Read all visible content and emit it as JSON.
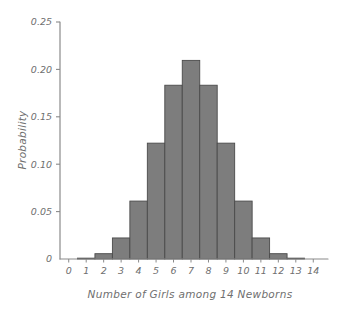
{
  "chart_data": {
    "type": "bar",
    "title": "",
    "xlabel": "Number of Girls among 14 Newborns",
    "ylabel": "Probability",
    "categories": [
      "0",
      "1",
      "2",
      "3",
      "4",
      "5",
      "6",
      "7",
      "8",
      "9",
      "10",
      "11",
      "12",
      "13",
      "14"
    ],
    "values": [
      0.0001,
      0.0009,
      0.0056,
      0.0222,
      0.0611,
      0.1222,
      0.1833,
      0.2095,
      0.1833,
      0.1222,
      0.0611,
      0.0222,
      0.0056,
      0.0009,
      0.0001
    ],
    "xlim": [
      -0.5,
      14.5
    ],
    "ylim": [
      0,
      0.25
    ],
    "ytick_labels": [
      "0.25",
      "0.20",
      "0.15",
      "0.10",
      "0.05",
      "0"
    ],
    "ytick_values": [
      0.25,
      0.2,
      0.15,
      0.1,
      0.05,
      0
    ],
    "xtick_labels": [
      "0",
      "1",
      "2",
      "3",
      "4",
      "5",
      "6",
      "7",
      "8",
      "9",
      "10",
      "11",
      "12",
      "13",
      "14"
    ],
    "grid": false,
    "legend": false,
    "bar_fill": "#7d7d7d",
    "bar_edge": "#4a4a4a",
    "axis_color": "#8a8a8a",
    "text_color": "#6f6f6f",
    "background": "#ffffff"
  },
  "axes": {
    "y_title": "Probability",
    "x_title": "Number of Girls among 14 Newborns"
  }
}
